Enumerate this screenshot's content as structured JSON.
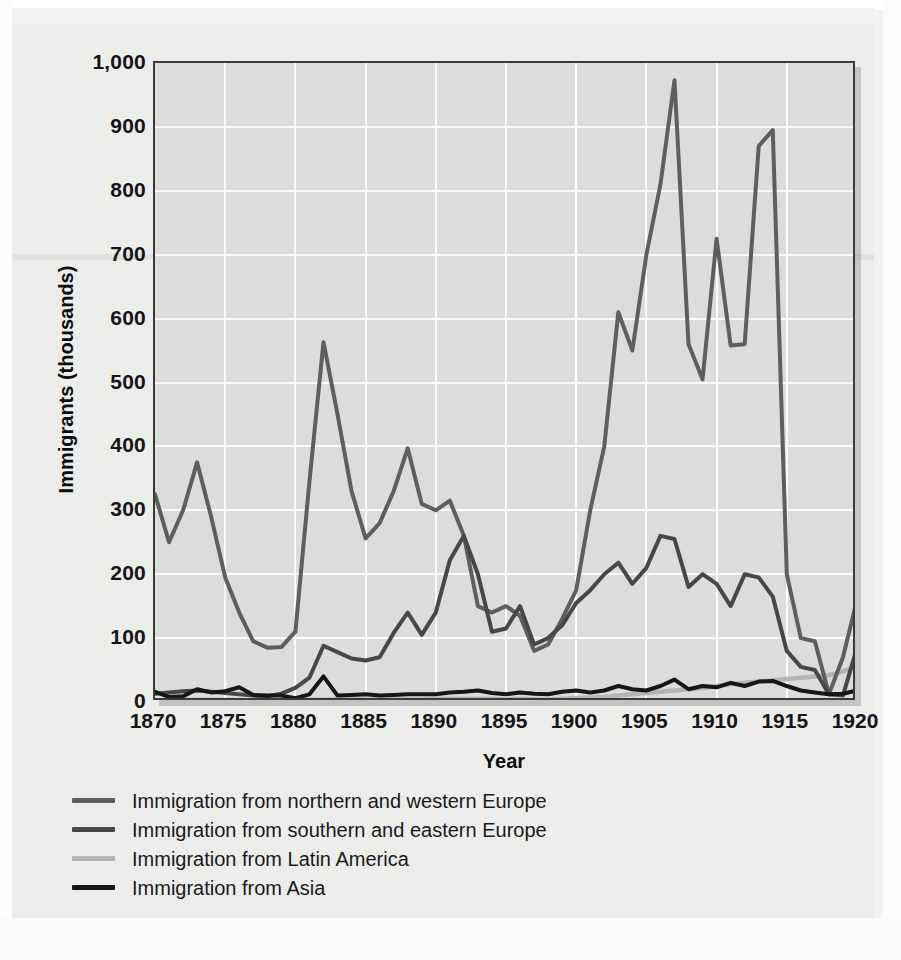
{
  "figure": {
    "background_color": "#ececeb",
    "plot_background_color": "#dcdcdb",
    "grid_color": "#fafafa",
    "frame_color": "#3a3a3a"
  },
  "axes": {
    "y_title": "Immigrants (thousands)",
    "x_title": "Year",
    "y_ticks": [
      "1,000",
      "900",
      "800",
      "700",
      "600",
      "500",
      "400",
      "300",
      "200",
      "100",
      "0"
    ],
    "x_ticks": [
      "1870",
      "1875",
      "1880",
      "1885",
      "1890",
      "1895",
      "1900",
      "1905",
      "1910",
      "1915",
      "1920"
    ]
  },
  "legend": {
    "position": "below-axes-left",
    "items": [
      {
        "label": "Immigration from northern and western Europe",
        "color": "#5e5e5e"
      },
      {
        "label": "Immigration from southern and eastern Europe",
        "color": "#474747"
      },
      {
        "label": "Immigration from Latin America",
        "color": "#b4b4b4"
      },
      {
        "label": "Immigration from Asia",
        "color": "#161616"
      }
    ]
  },
  "chart_data": {
    "type": "line",
    "title": "",
    "xlabel": "Year",
    "ylabel": "Immigrants (thousands)",
    "xlim": [
      1870,
      1920
    ],
    "ylim": [
      0,
      1000
    ],
    "ytick_step": 100,
    "xtick_step": 5,
    "grid": true,
    "legend_position": "below",
    "x": [
      1870,
      1871,
      1872,
      1873,
      1874,
      1875,
      1876,
      1877,
      1878,
      1879,
      1880,
      1881,
      1882,
      1883,
      1884,
      1885,
      1886,
      1887,
      1888,
      1889,
      1890,
      1891,
      1892,
      1893,
      1894,
      1895,
      1896,
      1897,
      1898,
      1899,
      1900,
      1901,
      1902,
      1903,
      1904,
      1905,
      1906,
      1907,
      1908,
      1909,
      1910,
      1911,
      1912,
      1913,
      1914,
      1915,
      1916,
      1917,
      1918,
      1919,
      1920
    ],
    "series": [
      {
        "name": "Immigration from northern and western Europe",
        "color": "#5e5e5e",
        "values": [
          325,
          250,
          300,
          375,
          290,
          195,
          140,
          95,
          85,
          86,
          110,
          345,
          563,
          450,
          330,
          256,
          280,
          330,
          397,
          310,
          300,
          315,
          260,
          150,
          140,
          150,
          135,
          80,
          90,
          130,
          175,
          300,
          400,
          610,
          550,
          700,
          810,
          973,
          560,
          505,
          725,
          558,
          560,
          870,
          895,
          200,
          100,
          95,
          12,
          70,
          160
        ]
      },
      {
        "name": "Immigration from southern and eastern Europe",
        "color": "#474747",
        "values": [
          13,
          15,
          17,
          18,
          16,
          14,
          12,
          10,
          9,
          13,
          22,
          38,
          88,
          78,
          68,
          65,
          70,
          108,
          140,
          105,
          140,
          222,
          260,
          200,
          110,
          115,
          150,
          90,
          100,
          120,
          155,
          175,
          200,
          218,
          185,
          210,
          260,
          255,
          180,
          200,
          185,
          150,
          200,
          195,
          165,
          80,
          55,
          50,
          12,
          10,
          85
        ]
      },
      {
        "name": "Immigration from Latin America",
        "color": "#b4b4b4",
        "values": [
          2,
          2,
          3,
          3,
          3,
          3,
          3,
          2,
          2,
          2,
          3,
          3,
          4,
          4,
          4,
          4,
          4,
          4,
          4,
          4,
          5,
          5,
          5,
          5,
          5,
          4,
          5,
          4,
          4,
          5,
          6,
          7,
          8,
          10,
          12,
          14,
          16,
          18,
          20,
          22,
          25,
          28,
          30,
          32,
          34,
          36,
          38,
          40,
          42,
          48,
          55
        ]
      },
      {
        "name": "Immigration from Asia",
        "color": "#161616",
        "values": [
          16,
          8,
          9,
          20,
          15,
          17,
          23,
          11,
          10,
          10,
          6,
          12,
          40,
          10,
          11,
          12,
          10,
          11,
          12,
          12,
          12,
          15,
          16,
          18,
          14,
          12,
          15,
          13,
          12,
          16,
          18,
          15,
          18,
          25,
          20,
          18,
          25,
          35,
          20,
          25,
          23,
          30,
          25,
          32,
          33,
          25,
          18,
          15,
          12,
          13,
          18
        ]
      }
    ]
  }
}
